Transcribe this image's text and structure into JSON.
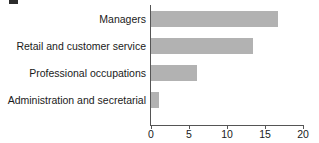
{
  "chart_data": {
    "type": "bar",
    "orientation": "horizontal",
    "title": "",
    "xlabel": "",
    "ylabel": "",
    "categories": [
      "Managers",
      "Retail and customer service",
      "Professional occupations",
      "Administration and secretarial"
    ],
    "values": [
      16.7,
      13.4,
      6.0,
      1.0
    ],
    "xlim": [
      0,
      20
    ],
    "xticks": [
      0,
      5,
      10,
      15,
      20
    ],
    "xtick_labels": [
      "0",
      "5",
      "10",
      "15",
      "20"
    ],
    "grid": false,
    "legend": null,
    "bar_color": "#b2b2b2",
    "axis_color": "#555555",
    "text_color": "#1a1a1a",
    "background": "#ffffff"
  }
}
